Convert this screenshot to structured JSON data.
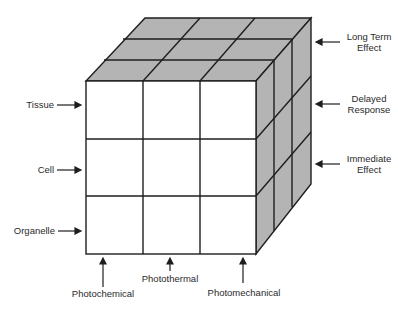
{
  "diagram": {
    "type": "3d-cube-matrix",
    "colors": {
      "front_face": "#ffffff",
      "top_face": "#b4b4b4",
      "side_face": "#b4b4b4",
      "lines": "#1e1e1e",
      "text": "#2a2a2a"
    },
    "left_axis": {
      "rows": [
        {
          "label": "Tissue"
        },
        {
          "label": "Cell"
        },
        {
          "label": "Organelle"
        }
      ]
    },
    "bottom_axis": {
      "columns": [
        {
          "label": "Photochemical"
        },
        {
          "label": "Photothermal"
        },
        {
          "label": "Photomechanical"
        }
      ]
    },
    "right_axis": {
      "layers": [
        {
          "line1": "Long Term",
          "line2": "Effect"
        },
        {
          "line1": "Delayed",
          "line2": "Response"
        },
        {
          "line1": "Immediate",
          "line2": "Effect"
        }
      ]
    }
  }
}
